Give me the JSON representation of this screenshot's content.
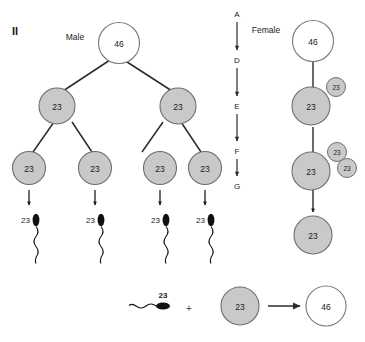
{
  "figure": {
    "panel_label": "II",
    "background": "#ffffff",
    "cell_fill_diploid": "#ffffff",
    "cell_fill_haploid": "#c9c9c9",
    "cell_stroke": "#6e6e6e",
    "line_color": "#2b2b2b",
    "sperm_color": "#111111"
  },
  "columns": {
    "male_label": "Male",
    "female_label": "Female"
  },
  "stages": {
    "label": "meiosis stage sequence",
    "items": [
      {
        "letter": "A"
      },
      {
        "letter": "D"
      },
      {
        "letter": "E"
      },
      {
        "letter": "F"
      },
      {
        "letter": "G"
      }
    ]
  },
  "male_tree": {
    "primary": {
      "count": "46"
    },
    "secondary": [
      {
        "count": "23"
      },
      {
        "count": "23"
      }
    ],
    "spermatids": [
      {
        "count": "23"
      },
      {
        "count": "23"
      },
      {
        "count": "23"
      },
      {
        "count": "23"
      }
    ],
    "sperm": [
      {
        "count": "23"
      },
      {
        "count": "23"
      },
      {
        "count": "23"
      },
      {
        "count": "23"
      }
    ]
  },
  "female_column": {
    "primary": {
      "count": "46"
    },
    "secondary": {
      "count": "23"
    },
    "first_polar_body": {
      "count": "23"
    },
    "ootid": {
      "count": "23"
    },
    "second_polar_bodies": [
      {
        "count": "23"
      },
      {
        "count": "23"
      }
    ],
    "ovum": {
      "count": "23"
    }
  },
  "fertilization": {
    "sperm": {
      "count": "23"
    },
    "plus": "+",
    "egg": {
      "count": "23"
    },
    "zygote": {
      "count": "46"
    }
  }
}
